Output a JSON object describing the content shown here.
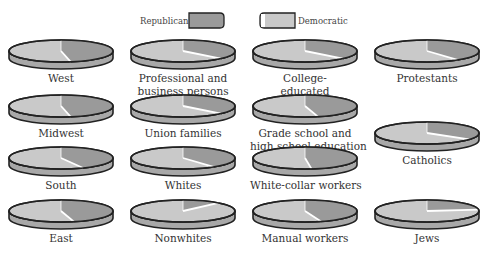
{
  "chart_data": {
    "type": "pie",
    "title": "",
    "legend": [
      {
        "name": "Republican",
        "color": "#9a9a9a"
      },
      {
        "name": "Democratic",
        "color": "#c9c9c9"
      }
    ],
    "legend_position": "top",
    "pies": [
      {
        "label": "West",
        "republican_pct": 47,
        "democratic_pct": 53
      },
      {
        "label": "Professional and business persons",
        "republican_pct": 37,
        "democratic_pct": 63
      },
      {
        "label": "College-educated",
        "republican_pct": 37,
        "democratic_pct": 63
      },
      {
        "label": "Protestants",
        "republican_pct": 40,
        "democratic_pct": 60
      },
      {
        "label": "Midwest",
        "republican_pct": 47,
        "democratic_pct": 53
      },
      {
        "label": "Union families",
        "republican_pct": 37,
        "democratic_pct": 63
      },
      {
        "label": "Grade school and high school education",
        "republican_pct": 46,
        "democratic_pct": 54
      },
      {
        "label": "Catholics",
        "republican_pct": 35,
        "democratic_pct": 65
      },
      {
        "label": "South",
        "republican_pct": 43,
        "democratic_pct": 57
      },
      {
        "label": "Whites",
        "republican_pct": 40,
        "democratic_pct": 60
      },
      {
        "label": "White-collar workers",
        "republican_pct": 48,
        "democratic_pct": 52
      },
      {
        "label": "East",
        "republican_pct": 46,
        "democratic_pct": 54
      },
      {
        "label": "Nonwhites",
        "republican_pct": 12,
        "democratic_pct": 88
      },
      {
        "label": "Manual workers",
        "republican_pct": 45,
        "democratic_pct": 55
      },
      {
        "label": "Jews",
        "republican_pct": 23,
        "democratic_pct": 77
      }
    ]
  },
  "legend": {
    "republican_label": "Republican",
    "democratic_label": "Democratic"
  },
  "labels": {
    "west": "West",
    "professional_1": "Professional and",
    "professional_2": "business persons",
    "college_1": "College-",
    "college_2": "educated",
    "protestants": "Protestants",
    "midwest": "Midwest",
    "union": "Union families",
    "grade_1": "Grade school and",
    "grade_2": "high school education",
    "catholics": "Catholics",
    "south": "South",
    "whites": "Whites",
    "whitecollar": "White-collar workers",
    "east": "East",
    "nonwhites": "Nonwhites",
    "manual": "Manual workers",
    "jews": "Jews"
  },
  "colors": {
    "republican": "#9a9a9a",
    "democratic": "#c9c9c9",
    "rim": "#a8a8a8",
    "outline": "#222222",
    "highlight": "#ffffff"
  }
}
